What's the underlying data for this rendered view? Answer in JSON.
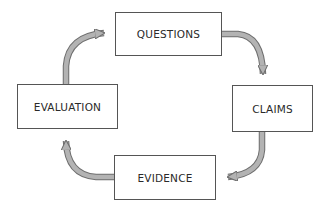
{
  "diagram": {
    "type": "cycle",
    "nodes": [
      {
        "id": "questions",
        "label": "QUESTIONS"
      },
      {
        "id": "claims",
        "label": "CLAIMS"
      },
      {
        "id": "evidence",
        "label": "EVIDENCE"
      },
      {
        "id": "evaluation",
        "label": "EVALUATION"
      }
    ],
    "edges": [
      {
        "from": "questions",
        "to": "claims"
      },
      {
        "from": "claims",
        "to": "evidence"
      },
      {
        "from": "evidence",
        "to": "evaluation"
      },
      {
        "from": "evaluation",
        "to": "questions"
      }
    ],
    "colors": {
      "arrow_fill": "#b3b3b3",
      "arrow_stroke": "#6e6e6e",
      "box_border": "#555555",
      "text": "#2a2a2a"
    }
  }
}
